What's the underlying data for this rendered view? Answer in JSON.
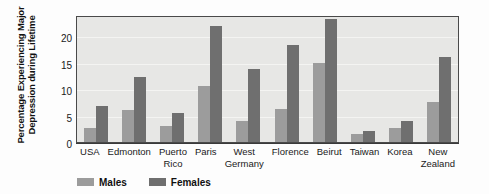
{
  "chart_data": {
    "type": "bar",
    "title": "",
    "xlabel": "",
    "ylabel_line1": "Percentage Experiencing Major",
    "ylabel_line2": "Depression during Lifetime",
    "categories": [
      "USA",
      "Edmonton",
      "Puerto Rico",
      "Paris",
      "West Germany",
      "Florence",
      "Beirut",
      "Taiwan",
      "Korea",
      "New Zealand"
    ],
    "category_lines": [
      {
        "line1": "USA",
        "line2": ""
      },
      {
        "line1": "Edmonton",
        "line2": ""
      },
      {
        "line1": "Puerto",
        "line2": "Rico"
      },
      {
        "line1": "Paris",
        "line2": ""
      },
      {
        "line1": "West",
        "line2": "Germany"
      },
      {
        "line1": "Florence",
        "line2": ""
      },
      {
        "line1": "Beirut",
        "line2": ""
      },
      {
        "line1": "Taiwan",
        "line2": ""
      },
      {
        "line1": "Korea",
        "line2": ""
      },
      {
        "line1": "New",
        "line2": "Zealand"
      }
    ],
    "series": [
      {
        "name": "Males",
        "color": "#9c9c9c",
        "values": [
          2.6,
          6.0,
          3.0,
          10.5,
          4.0,
          6.3,
          15.0,
          1.5,
          2.6,
          7.6
        ]
      },
      {
        "name": "Females",
        "color": "#6f6f6f",
        "values": [
          6.8,
          12.3,
          5.4,
          22.0,
          13.8,
          18.3,
          23.2,
          2.0,
          4.0,
          16.0
        ]
      }
    ],
    "ylim": [
      0,
      24
    ],
    "yticks": [
      0,
      5,
      10,
      15,
      20
    ],
    "ytick_labels": [
      "0",
      "5",
      "10",
      "15",
      "20"
    ],
    "grid": true,
    "legend_position": "bottom-left",
    "plot_background": "#e7e7e5",
    "gridline_color": "#f4f4f2",
    "axis_color": "#4a4a4a"
  }
}
